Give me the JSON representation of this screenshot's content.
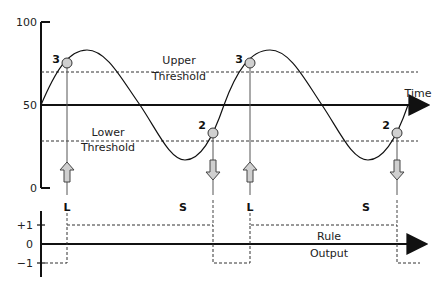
{
  "diagram": {
    "top_panel": {
      "y_ticks": {
        "top": "100",
        "mid": "50",
        "bottom": "0"
      },
      "x_axis_label": "Time",
      "upper_threshold": {
        "line1": "Upper",
        "line2": "Threshold"
      },
      "lower_threshold": {
        "line1": "Lower",
        "line2": "Threshold"
      },
      "markers": [
        {
          "label": "3",
          "signal": "L"
        },
        {
          "label": "2",
          "signal": "S"
        },
        {
          "label": "3",
          "signal": "L"
        },
        {
          "label": "2",
          "signal": "S"
        }
      ]
    },
    "bottom_panel": {
      "y_ticks": {
        "plus": "+1",
        "zero": "0",
        "minus": "−1"
      },
      "output_label": {
        "line1": "Rule",
        "line2": "Output"
      }
    },
    "colors": {
      "line": "#111111",
      "marker_fill": "#d0d0d0",
      "arrow_fill": "#cfcfcf"
    }
  }
}
